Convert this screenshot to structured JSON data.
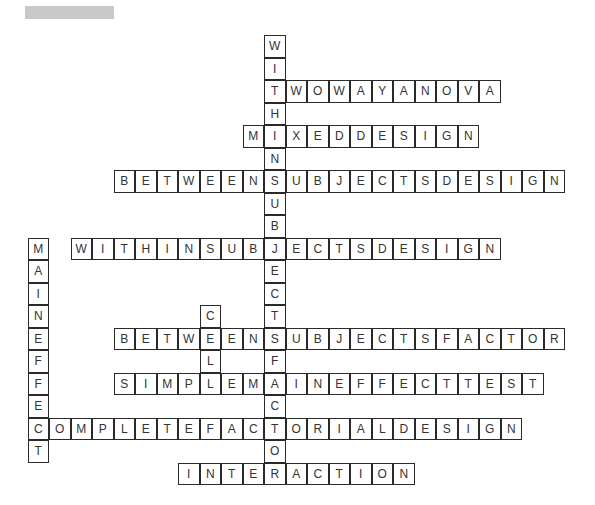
{
  "header": {
    "title_redacted": true
  },
  "grid": {
    "origin_x": 27.5,
    "origin_y": 35,
    "cell_w": 21.5,
    "cell_h": 22.5,
    "col_offset": 11
  },
  "words": [
    {
      "answer": "WITHINSUBJECTSFACTOR",
      "dir": "down",
      "row": 0,
      "col": 0
    },
    {
      "answer": "TWOWAYANOVA",
      "dir": "across",
      "row": 2,
      "col": 0
    },
    {
      "answer": "MIXEDDESIGN",
      "dir": "across",
      "row": 4,
      "col": -1
    },
    {
      "answer": "BETWEENSUBJECTSDESIGN",
      "dir": "across",
      "row": 6,
      "col": -7
    },
    {
      "answer": "WITHINSUBJECTSDESIGN",
      "dir": "across",
      "row": 9,
      "col": -9
    },
    {
      "answer": "MAINEFFECT",
      "dir": "down",
      "row": 9,
      "col": -11
    },
    {
      "answer": "CELL",
      "dir": "down",
      "row": 12,
      "col": -3
    },
    {
      "answer": "BETWEENSUBJECTSFACTOR",
      "dir": "across",
      "row": 13,
      "col": -7
    },
    {
      "answer": "SIMPLEMAINEFFECTTEST",
      "dir": "across",
      "row": 15,
      "col": -7
    },
    {
      "answer": "COMPLETEFACTORIALDESIGN",
      "dir": "across",
      "row": 17,
      "col": -11
    },
    {
      "answer": "INTERACTION",
      "dir": "across",
      "row": 19,
      "col": -4
    }
  ]
}
